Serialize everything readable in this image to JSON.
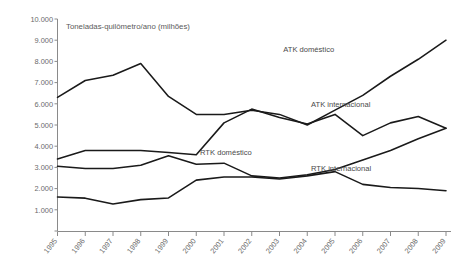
{
  "chart_data": {
    "type": "line",
    "title": "Toneladas-quilômetro/ano (milhões)",
    "xlabel": "",
    "ylabel": "",
    "x": [
      1995,
      1996,
      1997,
      1998,
      1999,
      2000,
      2001,
      2002,
      2003,
      2004,
      2005,
      2006,
      2007,
      2008,
      2009
    ],
    "categories": [
      "1995",
      "1996",
      "1997",
      "1998",
      "1999",
      "2000",
      "2001",
      "2002",
      "2003",
      "2004",
      "2005",
      "2006",
      "2007",
      "2008",
      "2009"
    ],
    "ylim": [
      0,
      10000
    ],
    "yticks": [
      1000,
      2000,
      3000,
      4000,
      5000,
      6000,
      7000,
      8000,
      9000,
      10000
    ],
    "ytick_labels": [
      "1.000",
      "2.000",
      "3.000",
      "4.000",
      "5.000",
      "6.000",
      "7.000",
      "8.000",
      "9.000",
      "10.000"
    ],
    "grid": false,
    "legend_position": "inline-annotations",
    "series": [
      {
        "name": "ATK doméstico",
        "label_x": 2004,
        "label_y": 8450,
        "values": [
          6300,
          7100,
          7350,
          7900,
          6350,
          5500,
          5500,
          5700,
          5500,
          5000,
          5700,
          6400,
          7300,
          8100,
          9000
        ]
      },
      {
        "name": "ATK internacional",
        "label_x": 2005,
        "label_y": 5850,
        "values": [
          3400,
          3800,
          3800,
          3800,
          3700,
          3600,
          5100,
          5750,
          5350,
          5050,
          5500,
          4500,
          5100,
          5400,
          4850
        ]
      },
      {
        "name": "RTK doméstico",
        "label_x": 2001,
        "label_y": 3600,
        "values": [
          3050,
          2950,
          2950,
          3100,
          3550,
          3150,
          3200,
          2600,
          2500,
          2650,
          2900,
          3350,
          3800,
          4350,
          4850
        ]
      },
      {
        "name": "RTK internacional",
        "label_x": 2005,
        "label_y": 2850,
        "values": [
          1600,
          1550,
          1270,
          1480,
          1560,
          2400,
          2550,
          2550,
          2450,
          2600,
          2800,
          2200,
          2050,
          2000,
          1900
        ]
      }
    ]
  },
  "colors": {
    "series_stroke": "#1a1a1a",
    "axis": "#8a8a8a",
    "tick_text": "#6b6b6b",
    "label_text": "#4a4a4a",
    "background": "#ffffff"
  }
}
